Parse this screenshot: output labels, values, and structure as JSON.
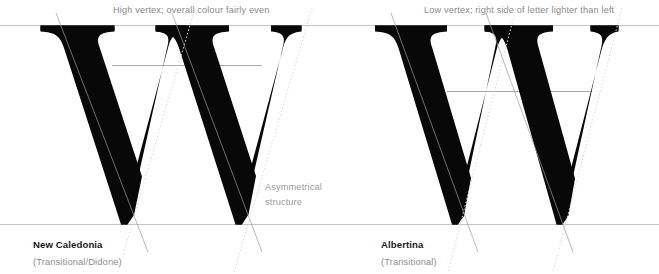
{
  "figure": {
    "background_color": "#ffffff",
    "glyph_color": "#080808",
    "guide_color": "#bdbdbd",
    "stress_line_color": "#9b9b9b",
    "dotted_line_color": "#d8d8d8",
    "annotation_color": "#8a8a8a",
    "label_color": "#1a1a1a",
    "sublabel_color": "#8f8f8f"
  },
  "annotations": {
    "top_left": "High vertex; overall colour fairly even",
    "top_right": "Low vertex; right side of letter lighter than left",
    "middle_line1": "Asymmetrical",
    "middle_line2": "structure"
  },
  "specimens": [
    {
      "glyph": "W",
      "name": "New Caledonia",
      "classification": "(Transitional/Didone)",
      "vertex_height": "high",
      "colour_evenness": "fairly even",
      "structure": "asymmetrical"
    },
    {
      "glyph": "W",
      "name": "Albertina",
      "classification": "(Transitional)",
      "vertex_height": "low",
      "colour_evenness": "right side lighter than left",
      "structure": "asymmetrical"
    }
  ],
  "guidelines": {
    "cap_height_label": "cap-height",
    "baseline_label": "baseline",
    "left_vertex_label": "left-vertex-height",
    "right_vertex_label": "right-vertex-height"
  }
}
